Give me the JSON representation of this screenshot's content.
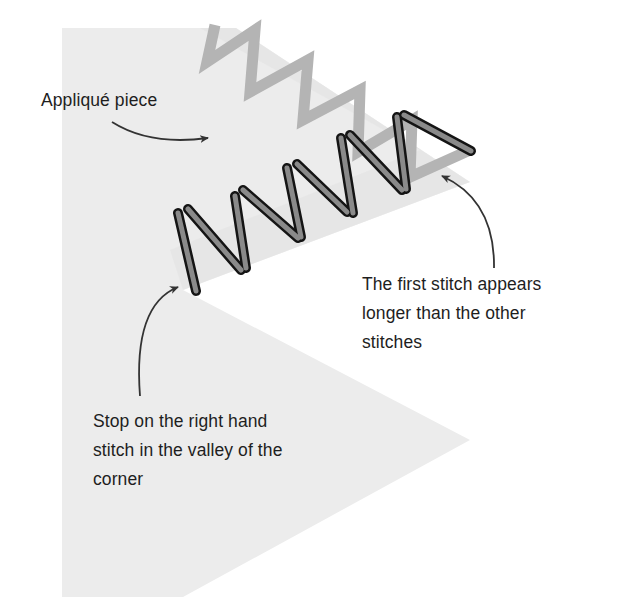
{
  "diagram": {
    "colors": {
      "background": "#ffffff",
      "applique_fabric": "#ececec",
      "fabric_band": "#e2e2e2",
      "previous_stitches": "#b4b4b4",
      "stitch_fill": "#8a8a8a",
      "stitch_outline": "#141414",
      "arrow": "#333333",
      "text": "#1e1e1e"
    },
    "labels": {
      "applique_piece": "Appliqué piece",
      "first_stitch": {
        "lines": [
          "The first stitch appears",
          "longer than the other",
          "stitches"
        ]
      },
      "stop_stitch": {
        "lines": [
          "Stop on the right hand",
          "stitch in the valley of the",
          "corner"
        ]
      }
    }
  }
}
